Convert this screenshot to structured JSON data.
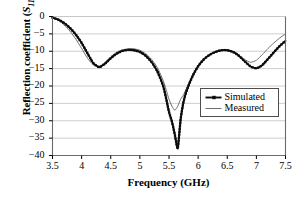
{
  "chart_data": {
    "type": "line",
    "title": "",
    "xlabel": "Frequency (GHz)",
    "ylabel_prefix": "Reflection coefficient (",
    "ylabel_symbol": "S",
    "ylabel_symbol_sub": "11",
    "ylabel_suffix": ",dB)",
    "ylabel_plain": "Reflection coefficient (S11,dB)",
    "xlim": [
      3.5,
      7.5
    ],
    "ylim": [
      -40,
      0
    ],
    "xticks": [
      "3.5",
      "4",
      "4.5",
      "5",
      "5.5",
      "6",
      "6.5",
      "7",
      "7.5"
    ],
    "xtick_values": [
      3.5,
      4,
      4.5,
      5,
      5.5,
      6,
      6.5,
      7,
      7.5
    ],
    "yticks": [
      "0",
      "−5",
      "−10",
      "−15",
      "−20",
      "−25",
      "−30",
      "−35",
      "−40"
    ],
    "ytick_values": [
      0,
      -5,
      -10,
      -15,
      -20,
      -25,
      -30,
      -35,
      -40
    ],
    "grid": "horizontal",
    "grid_color": "#c8c8c8",
    "frame_color": "#6b6b6b",
    "legend_position": "center-right",
    "series": [
      {
        "name": "Simulated",
        "color": "#0d0d0d",
        "width": 1.9,
        "marker": "square",
        "x": [
          3.5,
          3.6,
          3.7,
          3.8,
          3.9,
          4.0,
          4.1,
          4.2,
          4.3,
          4.4,
          4.5,
          4.6,
          4.7,
          4.8,
          4.9,
          5.0,
          5.1,
          5.2,
          5.3,
          5.4,
          5.45,
          5.5,
          5.55,
          5.6,
          5.65,
          5.7,
          5.75,
          5.8,
          5.9,
          6.0,
          6.1,
          6.2,
          6.3,
          6.4,
          6.5,
          6.6,
          6.7,
          6.8,
          6.9,
          7.0,
          7.1,
          7.2,
          7.3,
          7.4,
          7.5
        ],
        "y": [
          -0.3,
          -0.9,
          -1.9,
          -3.3,
          -5.2,
          -7.6,
          -10.6,
          -13.4,
          -14.6,
          -13.6,
          -12.0,
          -10.7,
          -9.9,
          -9.6,
          -9.7,
          -10.2,
          -11.3,
          -13.1,
          -15.8,
          -20.0,
          -23.5,
          -27.5,
          -30.2,
          -34.0,
          -38.0,
          -29.5,
          -24.5,
          -21.5,
          -17.3,
          -14.3,
          -12.3,
          -11.0,
          -10.2,
          -9.7,
          -9.7,
          -10.2,
          -11.3,
          -12.9,
          -14.4,
          -14.9,
          -14.0,
          -12.2,
          -10.3,
          -8.5,
          -7.0
        ]
      },
      {
        "name": "Measured",
        "color": "#6e6e6e",
        "width": 1.0,
        "marker": "none",
        "x": [
          3.5,
          3.6,
          3.7,
          3.8,
          3.9,
          4.0,
          4.1,
          4.2,
          4.3,
          4.4,
          4.5,
          4.6,
          4.7,
          4.8,
          4.9,
          5.0,
          5.1,
          5.2,
          5.3,
          5.4,
          5.45,
          5.5,
          5.55,
          5.6,
          5.65,
          5.7,
          5.75,
          5.8,
          5.9,
          6.0,
          6.1,
          6.2,
          6.3,
          6.4,
          6.5,
          6.6,
          6.7,
          6.8,
          6.9,
          7.0,
          7.1,
          7.2,
          7.3,
          7.4,
          7.5
        ],
        "y": [
          -0.3,
          -1.1,
          -2.4,
          -4.2,
          -6.5,
          -9.2,
          -12.0,
          -13.9,
          -14.4,
          -13.3,
          -11.6,
          -10.3,
          -9.6,
          -9.3,
          -9.3,
          -9.7,
          -10.7,
          -12.3,
          -14.7,
          -18.4,
          -21.0,
          -23.8,
          -25.8,
          -27.0,
          -25.8,
          -23.8,
          -22.5,
          -20.7,
          -17.0,
          -14.1,
          -12.2,
          -10.9,
          -10.1,
          -9.7,
          -9.7,
          -10.2,
          -11.2,
          -12.4,
          -13.2,
          -12.6,
          -11.0,
          -9.2,
          -7.6,
          -6.2,
          -5.0
        ]
      }
    ]
  }
}
